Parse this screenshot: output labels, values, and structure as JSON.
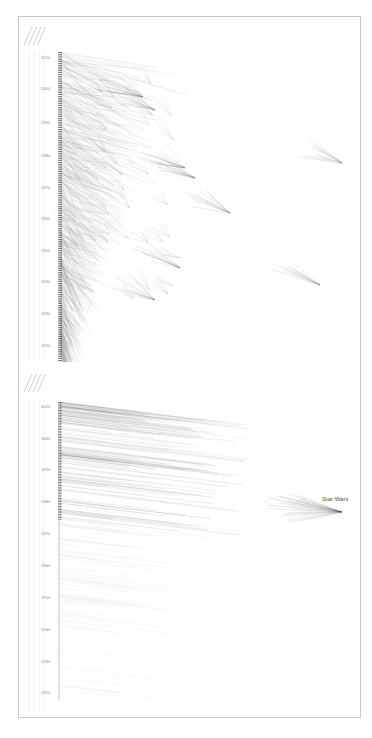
{
  "chart_data": [
    {
      "type": "scatter",
      "title": "",
      "panel": "top",
      "xlabel": "",
      "ylabel": "Year",
      "yticks": [
        "2010",
        "2000",
        "1990",
        "1980",
        "1970",
        "1960",
        "1950",
        "1940",
        "1930",
        "1920"
      ],
      "ylim": [
        1915,
        2014
      ],
      "rotated_column_labels": [
        "",
        "",
        "",
        ""
      ],
      "description": "Each film is a point on a vertical year axis; links fan out to referenced films placed to the right. Dense triangular cluster near the axis with scattered fan-shaped clusters.",
      "fans": [
        {
          "x": 143,
          "y": 97
        },
        {
          "x": 155,
          "y": 110
        },
        {
          "x": 185,
          "y": 168
        },
        {
          "x": 195,
          "y": 178
        },
        {
          "x": 230,
          "y": 213
        },
        {
          "x": 342,
          "y": 163
        },
        {
          "x": 320,
          "y": 285
        },
        {
          "x": 180,
          "y": 268
        },
        {
          "x": 155,
          "y": 300
        }
      ]
    },
    {
      "type": "scatter",
      "title": "",
      "panel": "bottom",
      "xlabel": "",
      "ylabel": "Year",
      "yticks": [
        "2010",
        "2000",
        "1990",
        "1980",
        "1970",
        "1960",
        "1950",
        "1940",
        "1930",
        "1920"
      ],
      "ylim": [
        1915,
        2014
      ],
      "annotations": [
        {
          "text": "Star Wars",
          "x": 322,
          "y": 499
        }
      ],
      "description": "Horizontal link lines from films (left axis) converge on a highlighted film 'Star Wars' on the right.",
      "fans": [
        {
          "x": 342,
          "y": 512,
          "label": "Star Wars"
        }
      ]
    }
  ],
  "top": {
    "yticks": [
      {
        "label": "2010",
        "y": 57
      },
      {
        "label": "2000",
        "y": 88
      },
      {
        "label": "1990",
        "y": 122
      },
      {
        "label": "1980",
        "y": 155
      },
      {
        "label": "1970",
        "y": 187
      },
      {
        "label": "1960",
        "y": 218
      },
      {
        "label": "1950",
        "y": 250
      },
      {
        "label": "1940",
        "y": 281
      },
      {
        "label": "1930",
        "y": 313
      },
      {
        "label": "1920",
        "y": 345
      }
    ]
  },
  "bottom": {
    "yticks": [
      {
        "label": "2010",
        "y": 406
      },
      {
        "label": "2000",
        "y": 438
      },
      {
        "label": "1990",
        "y": 469
      },
      {
        "label": "1980",
        "y": 501
      },
      {
        "label": "1970",
        "y": 533
      },
      {
        "label": "1960",
        "y": 565
      },
      {
        "label": "1950",
        "y": 597
      },
      {
        "label": "1940",
        "y": 629
      },
      {
        "label": "1930",
        "y": 661
      },
      {
        "label": "1920",
        "y": 692
      }
    ],
    "annotation": "Star Wars"
  }
}
